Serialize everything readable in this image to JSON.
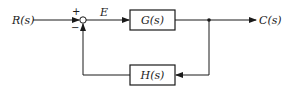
{
  "diagram": {
    "type": "negative feedback control loop",
    "input": {
      "label": "R(s)"
    },
    "output": {
      "label": "C(s)"
    },
    "summing_junction": {
      "plus_sign": "+",
      "minus_sign": "−"
    },
    "error_signal": {
      "label": "E"
    },
    "forward_block": {
      "label": "G(s)"
    },
    "feedback_block": {
      "label": "H(s)"
    },
    "colors": {
      "stroke": "#1a1a1a",
      "background": "#ffffff"
    }
  }
}
